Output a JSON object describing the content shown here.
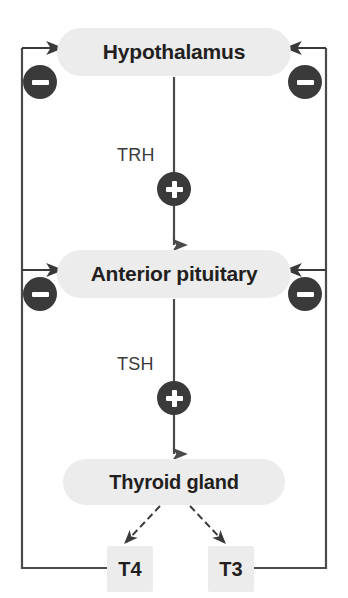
{
  "diagram": {
    "nodes": {
      "hypothalamus": "Hypothalamus",
      "anterior_pituitary": "Anterior pituitary",
      "thyroid_gland": "Thyroid gland"
    },
    "hormone_boxes": {
      "t4": "T4",
      "t3": "T3"
    },
    "hormone_labels": {
      "trh": "TRH",
      "tsh": "TSH"
    },
    "badges": {
      "plus": "+",
      "minus": "−"
    },
    "colors": {
      "node_fill": "#ececec",
      "node_text": "#231f20",
      "badge_fill": "#3a3a3a",
      "badge_glyph": "#ffffff",
      "line": "#4a4a4a",
      "background": "#ffffff"
    }
  }
}
